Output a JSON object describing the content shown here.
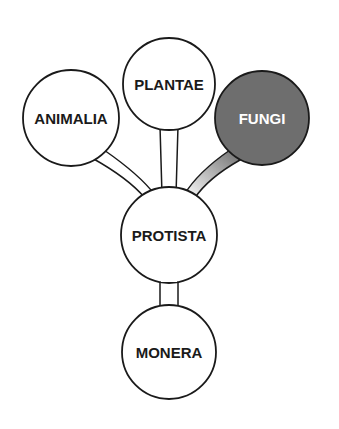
{
  "diagram": {
    "colors": {
      "stroke": "#1a1a1a",
      "node_fill": "#ffffff",
      "highlight_fill": "#6e6e6e",
      "highlight_text": "#ffffff",
      "text": "#1a1a1a"
    },
    "nodes": [
      {
        "id": "animalia",
        "label": "ANIMALIA",
        "cx": 71,
        "cy": 118,
        "r": 48,
        "highlight": false
      },
      {
        "id": "plantae",
        "label": "PLANTAE",
        "cx": 169,
        "cy": 84,
        "r": 46,
        "highlight": false
      },
      {
        "id": "fungi",
        "label": "FUNGI",
        "cx": 262,
        "cy": 118,
        "r": 47,
        "highlight": true
      },
      {
        "id": "protista",
        "label": "PROTISTA",
        "cx": 169,
        "cy": 235,
        "r": 48,
        "highlight": false
      },
      {
        "id": "monera",
        "label": "MONERA",
        "cx": 169,
        "cy": 352,
        "r": 47,
        "highlight": false
      }
    ],
    "edges": [
      {
        "from": "monera",
        "to": "protista"
      },
      {
        "from": "protista",
        "to": "animalia"
      },
      {
        "from": "protista",
        "to": "plantae"
      },
      {
        "from": "protista",
        "to": "fungi",
        "highlight": true
      }
    ]
  }
}
